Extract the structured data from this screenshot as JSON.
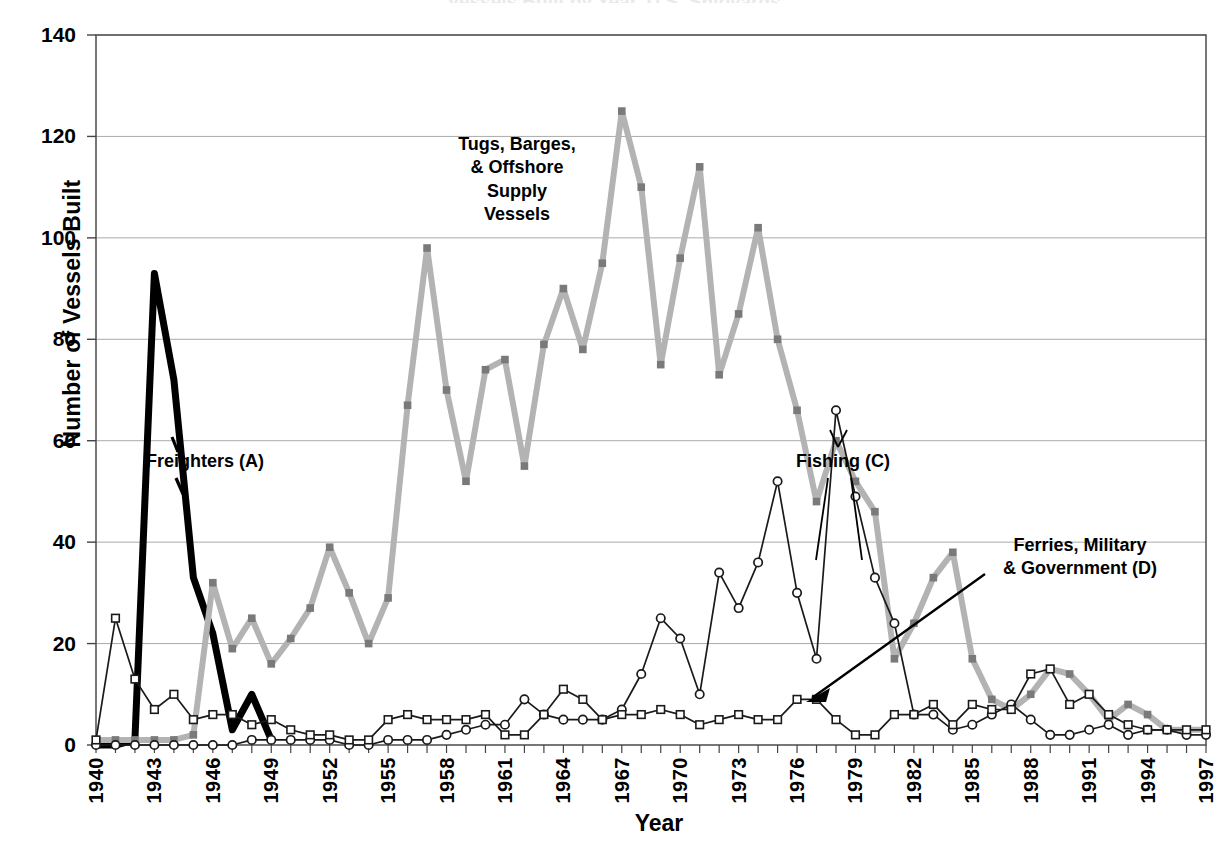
{
  "title_partial": "Vessels Built by Year, U.S. Shipyards",
  "axes": {
    "ylabel": "Number of Vessels Built",
    "xlabel": "Year",
    "yticks": [
      0,
      20,
      40,
      60,
      80,
      100,
      120,
      140
    ],
    "ylim": [
      0,
      140
    ],
    "xlim": [
      1940,
      1997
    ],
    "xtick_labels": [
      "1940",
      "1943",
      "1946",
      "1949",
      "1952",
      "1955",
      "1958",
      "1961",
      "1964",
      "1967",
      "1970",
      "1973",
      "1976",
      "1979",
      "1982",
      "1985",
      "1988",
      "1991",
      "1994",
      "1997"
    ],
    "xtick_step": 3,
    "grid": "horizontal"
  },
  "annotations": {
    "tugs": "Tugs, Barges,\n& Offshore\nSupply\nVessels",
    "freighters": "Freighters (A)",
    "fishing": "Fishing (C)",
    "ferries": "Ferries, Military\n& Government (D)"
  },
  "colors": {
    "freighters": "#000000",
    "tugs": "#b3b3b3",
    "fishing": "#1a1a1a",
    "ferries": "#1a1a1a",
    "grid": "#aaaaaa",
    "axis": "#555555",
    "background": "#ffffff"
  },
  "chart_data": {
    "type": "line",
    "title": "Vessels Built by Year, U.S. Shipyards",
    "xlabel": "Year",
    "ylabel": "Number of Vessels Built",
    "ylim": [
      0,
      140
    ],
    "xlim": [
      1940,
      1997
    ],
    "grid": true,
    "legend": "annotated-inline",
    "x": [
      1940,
      1941,
      1942,
      1943,
      1944,
      1945,
      1946,
      1947,
      1948,
      1949,
      1950,
      1951,
      1952,
      1953,
      1954,
      1955,
      1956,
      1957,
      1958,
      1959,
      1960,
      1961,
      1962,
      1963,
      1964,
      1965,
      1966,
      1967,
      1968,
      1969,
      1970,
      1971,
      1972,
      1973,
      1974,
      1975,
      1976,
      1977,
      1978,
      1979,
      1980,
      1981,
      1982,
      1983,
      1984,
      1985,
      1986,
      1987,
      1988,
      1989,
      1990,
      1991,
      1992,
      1993,
      1994,
      1995,
      1996,
      1997
    ],
    "series": [
      {
        "name": "Freighters (A)",
        "marker": "none",
        "linewidth": "thick",
        "color": "#000000",
        "values": [
          0,
          0,
          1,
          93,
          72,
          33,
          22,
          3,
          10,
          1,
          null,
          null,
          null,
          null,
          null,
          null,
          null,
          null,
          null,
          null,
          null,
          null,
          null,
          null,
          null,
          null,
          null,
          null,
          null,
          null,
          null,
          null,
          null,
          null,
          null,
          null,
          null,
          null,
          null,
          null,
          null,
          null,
          null,
          null,
          null,
          null,
          null,
          null,
          null,
          null,
          null,
          null,
          null,
          null,
          null,
          null,
          null,
          null
        ]
      },
      {
        "name": "Tugs, Barges, & Offshore Supply Vessels",
        "marker": "square",
        "linewidth": "thick",
        "color": "#b3b3b3",
        "values": [
          1,
          1,
          1,
          1,
          1,
          2,
          32,
          19,
          25,
          16,
          21,
          27,
          39,
          30,
          20,
          29,
          67,
          98,
          70,
          52,
          74,
          76,
          55,
          79,
          90,
          78,
          95,
          125,
          110,
          75,
          96,
          114,
          73,
          85,
          102,
          80,
          66,
          48,
          60,
          52,
          46,
          17,
          24,
          33,
          38,
          17,
          9,
          7,
          10,
          15,
          14,
          10,
          5,
          8,
          6,
          3,
          3,
          3
        ]
      },
      {
        "name": "Fishing (C)",
        "marker": "circle",
        "linewidth": "thin",
        "color": "#1a1a1a",
        "values": [
          0,
          0,
          0,
          0,
          0,
          0,
          0,
          0,
          1,
          1,
          1,
          1,
          1,
          0,
          0,
          1,
          1,
          1,
          2,
          3,
          4,
          4,
          9,
          6,
          5,
          5,
          5,
          7,
          14,
          25,
          21,
          10,
          34,
          27,
          36,
          52,
          30,
          17,
          66,
          49,
          33,
          24,
          6,
          6,
          3,
          4,
          6,
          8,
          5,
          2,
          2,
          3,
          4,
          2,
          3,
          3,
          2,
          2
        ]
      },
      {
        "name": "Ferries, Military & Government (D)",
        "marker": "square",
        "linewidth": "thin",
        "color": "#1a1a1a",
        "values": [
          1,
          25,
          13,
          7,
          10,
          5,
          6,
          6,
          4,
          5,
          3,
          2,
          2,
          1,
          1,
          5,
          6,
          5,
          5,
          5,
          6,
          2,
          2,
          6,
          11,
          9,
          5,
          6,
          6,
          7,
          6,
          4,
          5,
          6,
          5,
          5,
          9,
          9,
          5,
          2,
          2,
          6,
          6,
          8,
          4,
          8,
          7,
          7,
          14,
          15,
          8,
          10,
          6,
          4,
          3,
          3,
          3,
          3
        ]
      }
    ]
  }
}
